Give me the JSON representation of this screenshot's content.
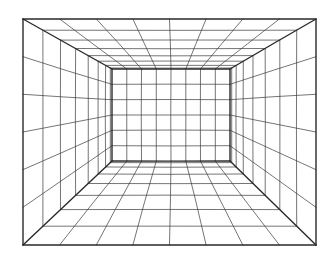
{
  "illustration": {
    "subject": "one-point perspective room grid",
    "line_color": "#3a3a3a",
    "edge_color": "#2a2a2a",
    "background": "#ffffff",
    "outer_frame": {
      "left": 23,
      "top": 19,
      "right": 316,
      "bottom": 245
    },
    "back_wall": {
      "left": 112,
      "top": 69,
      "right": 230,
      "bottom": 161
    },
    "back_wall_grid": {
      "columns": 8,
      "rows": 6
    },
    "depth_divisions": 8
  }
}
